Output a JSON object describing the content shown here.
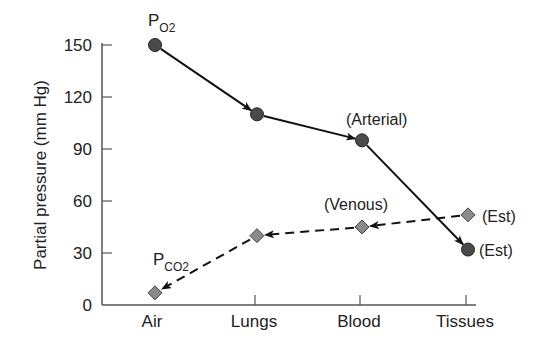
{
  "chart_data": {
    "type": "line",
    "title": "",
    "xlabel": "",
    "ylabel": "Partial pressure (mm Hg)",
    "categories": [
      "Air",
      "Lungs",
      "Blood",
      "Tissues"
    ],
    "ylim": [
      0,
      150
    ],
    "yticks": [
      0,
      30,
      60,
      90,
      120,
      150
    ],
    "grid": false,
    "legend": "none (series labeled inline)",
    "series": [
      {
        "name": "PO2",
        "label_main": "P",
        "label_sub": "O2",
        "marker": "circle",
        "line": "solid",
        "arrow_direction": "Air→Lungs→Blood→Tissues",
        "values": [
          150,
          110,
          95,
          32
        ],
        "color": "#444444"
      },
      {
        "name": "PCO2",
        "label_main": "P",
        "label_sub": "CO2",
        "marker": "diamond",
        "line": "dashed",
        "arrow_direction": "Tissues→Blood→Lungs→Air",
        "values": [
          7,
          40,
          45,
          52
        ],
        "color": "#888888"
      }
    ],
    "annotations": [
      {
        "text": "(Arterial)",
        "series": "PO2",
        "category": "Blood"
      },
      {
        "text": "(Est)",
        "series": "PO2",
        "category": "Tissues"
      },
      {
        "text": "(Venous)",
        "series": "PCO2",
        "category": "Blood"
      },
      {
        "text": "(Est)",
        "series": "PCO2",
        "category": "Tissues"
      }
    ]
  }
}
